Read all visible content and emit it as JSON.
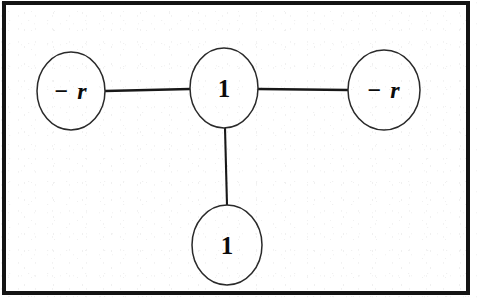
{
  "figure": {
    "background_color": "#ffffff",
    "frame_color": "#141414",
    "stroke_color": "#2a2a2a",
    "label_color": "#0b0b0b"
  },
  "graph_data": {
    "type": "diagram",
    "layout": "star",
    "node_count": 4,
    "edge_count": 3,
    "nodes": [
      {
        "id": "left",
        "label": "− r",
        "style": "italic-bold",
        "cx": 71,
        "cy": 91,
        "rx": 34,
        "ry": 39
      },
      {
        "id": "center",
        "label": "1",
        "style": "bold",
        "cx": 224,
        "cy": 88,
        "rx": 34,
        "ry": 40
      },
      {
        "id": "right",
        "label": "− r",
        "style": "italic-bold",
        "cx": 384,
        "cy": 90,
        "rx": 36,
        "ry": 40
      },
      {
        "id": "bottom",
        "label": "1",
        "style": "bold",
        "cx": 227,
        "cy": 245,
        "rx": 35,
        "ry": 40
      }
    ],
    "edges": [
      {
        "id": "edge-left-center",
        "from": "left",
        "to": "center",
        "orientation": "horizontal",
        "x1": 105,
        "y1": 91,
        "x2": 190,
        "y2": 89,
        "width": 2.6
      },
      {
        "id": "edge-center-right",
        "from": "center",
        "to": "right",
        "orientation": "horizontal",
        "x1": 258,
        "y1": 89,
        "x2": 348,
        "y2": 90,
        "width": 2.6
      },
      {
        "id": "edge-center-bottom",
        "from": "center",
        "to": "bottom",
        "orientation": "vertical",
        "x1": 225,
        "y1": 128,
        "x2": 227,
        "y2": 205,
        "width": 2.1
      }
    ]
  }
}
